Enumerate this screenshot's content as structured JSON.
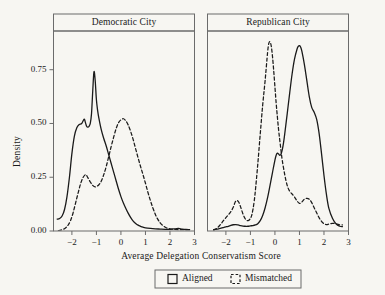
{
  "figure": {
    "background_color": "#f7f6f2",
    "line_color": "#1a1a1a",
    "panel_border_color": "#6b6b6b",
    "width": 385,
    "height": 295
  },
  "axes": {
    "ylabel": "Density",
    "xlabel": "Average Delegation Conservatism Score",
    "yticks": [
      "0.00",
      "0.25",
      "0.50",
      "0.75"
    ],
    "xticks": [
      "-2",
      "-1",
      "0",
      "1",
      "2",
      "3"
    ]
  },
  "panels": [
    {
      "strip_label": "Democratic City"
    },
    {
      "strip_label": "Republican City"
    }
  ],
  "legend": {
    "items": [
      {
        "label": "Aligned",
        "style": "solid",
        "swatch": "square-outline"
      },
      {
        "label": "Mismatched",
        "style": "dashed",
        "swatch": "square-dashed"
      }
    ]
  },
  "chart_data": {
    "type": "line",
    "subtype": "kernel-density",
    "title": "",
    "xlabel": "Average Delegation Conservatism Score",
    "ylabel": "Density",
    "xlim": [
      -2.75,
      3.0
    ],
    "ylim": [
      0.0,
      0.93
    ],
    "xticks": [
      -2,
      -1,
      0,
      1,
      2,
      3
    ],
    "yticks": [
      0.0,
      0.25,
      0.5,
      0.75
    ],
    "grid": false,
    "legend_position": "bottom",
    "facets": [
      {
        "name": "Democratic City",
        "series": [
          {
            "name": "Aligned",
            "style": "solid",
            "peak_x": -1.1,
            "peak_y": 0.74,
            "x": [
              -2.6,
              -2.5,
              -2.4,
              -2.3,
              -2.2,
              -2.1,
              -2.0,
              -1.9,
              -1.8,
              -1.7,
              -1.6,
              -1.5,
              -1.45,
              -1.4,
              -1.35,
              -1.3,
              -1.25,
              -1.2,
              -1.15,
              -1.1,
              -1.05,
              -1.0,
              -0.95,
              -0.9,
              -0.8,
              -0.7,
              -0.6,
              -0.5,
              -0.4,
              -0.3,
              -0.2,
              -0.1,
              0.0,
              0.1,
              0.2,
              0.3,
              0.4,
              0.5,
              0.6,
              0.7,
              0.8,
              0.9,
              1.0,
              1.2,
              1.4,
              1.6,
              1.8,
              2.0,
              2.2,
              2.35,
              2.5,
              2.65,
              2.8
            ],
            "y": [
              0.055,
              0.058,
              0.07,
              0.1,
              0.16,
              0.25,
              0.36,
              0.44,
              0.48,
              0.495,
              0.5,
              0.52,
              0.505,
              0.487,
              0.483,
              0.487,
              0.5,
              0.545,
              0.65,
              0.74,
              0.7,
              0.61,
              0.56,
              0.525,
              0.47,
              0.43,
              0.395,
              0.355,
              0.315,
              0.275,
              0.235,
              0.195,
              0.16,
              0.13,
              0.105,
              0.082,
              0.062,
              0.046,
              0.035,
              0.027,
              0.022,
              0.018,
              0.015,
              0.012,
              0.01,
              0.009,
              0.008,
              0.008,
              0.01,
              0.012,
              0.009,
              0.007,
              0.006
            ]
          },
          {
            "name": "Mismatched",
            "style": "dashed",
            "peak_x": 0.1,
            "peak_y": 0.52,
            "x": [
              -2.55,
              -2.45,
              -2.35,
              -2.25,
              -2.15,
              -2.05,
              -1.95,
              -1.85,
              -1.75,
              -1.65,
              -1.55,
              -1.45,
              -1.4,
              -1.35,
              -1.25,
              -1.15,
              -1.05,
              -0.95,
              -0.9,
              -0.85,
              -0.8,
              -0.7,
              -0.6,
              -0.5,
              -0.4,
              -0.3,
              -0.2,
              -0.1,
              0.0,
              0.1,
              0.2,
              0.3,
              0.4,
              0.5,
              0.6,
              0.7,
              0.8,
              0.9,
              1.0,
              1.1,
              1.2,
              1.3,
              1.4,
              1.5,
              1.6,
              1.7,
              1.85,
              2.0,
              2.2,
              2.4,
              2.6,
              2.8
            ],
            "y": [
              0.002,
              0.004,
              0.008,
              0.015,
              0.028,
              0.05,
              0.085,
              0.13,
              0.175,
              0.218,
              0.248,
              0.262,
              0.258,
              0.248,
              0.228,
              0.212,
              0.205,
              0.21,
              0.215,
              0.222,
              0.232,
              0.262,
              0.3,
              0.345,
              0.392,
              0.435,
              0.475,
              0.503,
              0.517,
              0.522,
              0.512,
              0.492,
              0.462,
              0.425,
              0.382,
              0.34,
              0.3,
              0.262,
              0.222,
              0.18,
              0.142,
              0.108,
              0.078,
              0.055,
              0.038,
              0.026,
              0.015,
              0.01,
              0.007,
              0.006,
              0.006,
              0.006
            ]
          }
        ]
      },
      {
        "name": "Republican City",
        "series": [
          {
            "name": "Aligned",
            "style": "solid",
            "peak_x": 1.0,
            "peak_y": 0.86,
            "x": [
              -2.5,
              -2.4,
              -2.3,
              -2.2,
              -2.1,
              -2.0,
              -1.9,
              -1.8,
              -1.7,
              -1.6,
              -1.5,
              -1.4,
              -1.3,
              -1.2,
              -1.1,
              -1.0,
              -0.9,
              -0.8,
              -0.7,
              -0.6,
              -0.5,
              -0.4,
              -0.3,
              -0.2,
              -0.1,
              0.0,
              0.05,
              0.1,
              0.15,
              0.2,
              0.25,
              0.3,
              0.35,
              0.4,
              0.5,
              0.6,
              0.7,
              0.8,
              0.9,
              0.95,
              1.0,
              1.05,
              1.1,
              1.2,
              1.3,
              1.4,
              1.5,
              1.6,
              1.7,
              1.8,
              1.9,
              2.0,
              2.1,
              2.2,
              2.35,
              2.5,
              2.65,
              2.75
            ],
            "y": [
              0.006,
              0.008,
              0.01,
              0.013,
              0.016,
              0.019,
              0.022,
              0.026,
              0.029,
              0.03,
              0.028,
              0.025,
              0.023,
              0.022,
              0.022,
              0.024,
              0.025,
              0.028,
              0.034,
              0.048,
              0.072,
              0.108,
              0.155,
              0.212,
              0.272,
              0.33,
              0.352,
              0.362,
              0.358,
              0.352,
              0.358,
              0.378,
              0.41,
              0.452,
              0.545,
              0.64,
              0.73,
              0.8,
              0.845,
              0.858,
              0.862,
              0.855,
              0.835,
              0.775,
              0.7,
              0.625,
              0.575,
              0.552,
              0.52,
              0.455,
              0.36,
              0.258,
              0.17,
              0.105,
              0.058,
              0.032,
              0.022,
              0.02
            ]
          },
          {
            "name": "Mismatched",
            "style": "dashed",
            "peak_x": -0.25,
            "peak_y": 0.88,
            "x": [
              -2.5,
              -2.4,
              -2.3,
              -2.2,
              -2.1,
              -2.0,
              -1.9,
              -1.8,
              -1.7,
              -1.62,
              -1.55,
              -1.48,
              -1.4,
              -1.3,
              -1.2,
              -1.1,
              -1.0,
              -0.95,
              -0.9,
              -0.85,
              -0.8,
              -0.7,
              -0.6,
              -0.5,
              -0.4,
              -0.3,
              -0.25,
              -0.2,
              -0.15,
              -0.1,
              -0.05,
              0.0,
              0.05,
              0.1,
              0.15,
              0.2,
              0.25,
              0.3,
              0.4,
              0.5,
              0.6,
              0.7,
              0.8,
              0.9,
              1.0,
              1.1,
              1.2,
              1.3,
              1.4,
              1.5,
              1.6,
              1.7,
              1.8,
              1.9,
              2.0,
              2.1,
              2.2,
              2.35,
              2.5,
              2.65,
              2.75
            ],
            "y": [
              0.004,
              0.01,
              0.02,
              0.033,
              0.048,
              0.062,
              0.075,
              0.09,
              0.11,
              0.135,
              0.142,
              0.135,
              0.112,
              0.078,
              0.055,
              0.048,
              0.058,
              0.072,
              0.098,
              0.135,
              0.185,
              0.31,
              0.45,
              0.585,
              0.7,
              0.83,
              0.872,
              0.88,
              0.86,
              0.812,
              0.745,
              0.67,
              0.595,
              0.53,
              0.47,
              0.42,
              0.372,
              0.328,
              0.262,
              0.212,
              0.185,
              0.172,
              0.158,
              0.14,
              0.128,
              0.135,
              0.148,
              0.152,
              0.148,
              0.132,
              0.108,
              0.085,
              0.062,
              0.045,
              0.034,
              0.03,
              0.032,
              0.036,
              0.033,
              0.028,
              0.028
            ]
          }
        ]
      }
    ]
  }
}
